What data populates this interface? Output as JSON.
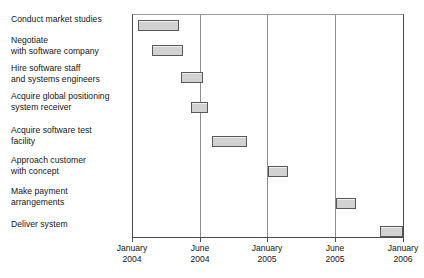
{
  "chart_data": {
    "type": "bar",
    "chart_kind": "gantt",
    "title": "",
    "subtitle": "",
    "xlabel": "",
    "ylabel": "",
    "grid": true,
    "legend": "none",
    "x_axis": {
      "type": "time",
      "ticks": [
        {
          "month": "January",
          "year": "2004",
          "month_index": 0
        },
        {
          "month": "June",
          "year": "2004",
          "month_index": 5
        },
        {
          "month": "January",
          "year": "2005",
          "month_index": 12
        },
        {
          "month": "June",
          "year": "2005",
          "month_index": 17
        },
        {
          "month": "January",
          "year": "2006",
          "month_index": 24
        }
      ],
      "range_start_label": "January 2004",
      "range_end_label": "January 2006"
    },
    "categories": [
      "Conduct market studies",
      "Negotiate\nwith software company",
      "Hire software staff\nand systems engineers",
      "Acquire global positioning\nsystem receiver",
      "Acquire software test\nfacility",
      "Approach customer\nwith concept",
      "Make payment\narrangements",
      "Deliver system"
    ],
    "tasks": [
      {
        "name": "Conduct market studies",
        "label": "Conduct market studies",
        "start_label": "January 2004",
        "end_label": "April 2004",
        "start_pct": 1.8,
        "duration_pct": 15.1,
        "row": 0
      },
      {
        "name": "Negotiate with software company",
        "label": "Negotiate\nwith software company",
        "start_label": "March 2004",
        "end_label": "May 2004",
        "start_pct": 7.0,
        "duration_pct": 11.4,
        "row": 1
      },
      {
        "name": "Hire software staff and systems engineers",
        "label": "Hire software staff\nand systems engineers",
        "start_label": "May 2004",
        "end_label": "July 2004",
        "start_pct": 17.6,
        "duration_pct": 8.5,
        "row": 2
      },
      {
        "name": "Acquire global positioning system receiver",
        "label": "Acquire global positioning\nsystem receiver",
        "start_label": "June 2004",
        "end_label": "August 2004",
        "start_pct": 21.3,
        "duration_pct": 6.6,
        "row": 3
      },
      {
        "name": "Acquire software test facility",
        "label": "Acquire software test\nfacility",
        "start_label": "August 2004",
        "end_label": "December 2004",
        "start_pct": 29.4,
        "duration_pct": 12.9,
        "row": 4
      },
      {
        "name": "Approach customer with concept",
        "label": "Approach customer\nwith concept",
        "start_label": "January 2005",
        "end_label": "March 2005",
        "start_pct": 50.0,
        "duration_pct": 7.4,
        "row": 5
      },
      {
        "name": "Make payment arrangements",
        "label": "Make payment\narrangements",
        "start_label": "June 2005",
        "end_label": "August 2005",
        "start_pct": 75.0,
        "duration_pct": 7.7,
        "row": 6
      },
      {
        "name": "Deliver system",
        "label": "Deliver system",
        "start_label": "November 2005",
        "end_label": "January 2006",
        "start_pct": 91.5,
        "duration_pct": 8.5,
        "row": 7
      }
    ],
    "colors": {
      "bar_fill": "#d2d2d2",
      "bar_border": "#585858",
      "axis": "#4b4b4b",
      "gridline": "#8d8d8d",
      "text": "#161616",
      "background": "#ffffff"
    }
  },
  "labels": {
    "task_0": "Conduct market studies",
    "task_1": "Negotiate\nwith software company",
    "task_2": "Hire software staff\nand systems engineers",
    "task_3": "Acquire global positioning\nsystem receiver",
    "task_4": "Acquire software test\nfacility",
    "task_5": "Approach customer\nwith concept",
    "task_6": "Make payment\narrangements",
    "task_7": "Deliver system"
  },
  "axis": {
    "tick_0_month": "January",
    "tick_0_year": "2004",
    "tick_1_month": "June",
    "tick_1_year": "2004",
    "tick_2_month": "January",
    "tick_2_year": "2005",
    "tick_3_month": "June",
    "tick_3_year": "2005",
    "tick_4_month": "January",
    "tick_4_year": "2006"
  }
}
